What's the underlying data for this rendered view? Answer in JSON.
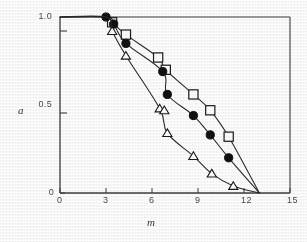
{
  "figure": {
    "background_color": "#ffffff",
    "ink_color": "#2b2b2b",
    "marker_edge_color": "#1a1a1a",
    "marker_open_fill": "#ffffff",
    "marker_filled_fill": "#111111"
  },
  "axes": {
    "x_title": "m",
    "y_title": "a",
    "x_ticks": [
      "0",
      "3",
      "6",
      "9",
      "12",
      "15"
    ],
    "y_ticks": [
      "0",
      "0.5",
      "1.0"
    ]
  },
  "chart_data": {
    "type": "line",
    "title": "",
    "subtitle": "",
    "xlabel": "m",
    "ylabel": "a",
    "xlim": [
      0,
      15
    ],
    "ylim": [
      0,
      1.0
    ],
    "x_ticks": [
      0,
      3,
      6,
      9,
      12,
      15
    ],
    "y_ticks": [
      0,
      0.5,
      1.0
    ],
    "grid": false,
    "legend": "none",
    "annotations": [
      "All three curves share a plateau at a = 1.0 for m from 0 to about 3",
      "All three curves converge to a = 0 at about m = 13"
    ],
    "series": [
      {
        "name": "open-square-series",
        "marker": "open-square",
        "marker_fill": "#ffffff",
        "marker_edge": "#1a1a1a",
        "line_color": "#2b2b2b",
        "points": [
          {
            "x": 0.0,
            "y": 1.0
          },
          {
            "x": 3.0,
            "y": 1.0
          },
          {
            "x": 3.4,
            "y": 0.97
          },
          {
            "x": 4.3,
            "y": 0.9
          },
          {
            "x": 6.4,
            "y": 0.77
          },
          {
            "x": 6.9,
            "y": 0.7
          },
          {
            "x": 8.7,
            "y": 0.56
          },
          {
            "x": 9.8,
            "y": 0.47
          },
          {
            "x": 11.0,
            "y": 0.32
          },
          {
            "x": 13.0,
            "y": 0.0
          }
        ],
        "markers_drawn_at": [
          {
            "x": 3.4,
            "y": 0.97
          },
          {
            "x": 4.3,
            "y": 0.9
          },
          {
            "x": 6.4,
            "y": 0.77
          },
          {
            "x": 6.9,
            "y": 0.7
          },
          {
            "x": 8.7,
            "y": 0.56
          },
          {
            "x": 9.8,
            "y": 0.47
          },
          {
            "x": 11.0,
            "y": 0.32
          }
        ]
      },
      {
        "name": "filled-circle-series",
        "marker": "filled-circle",
        "marker_fill": "#111111",
        "marker_edge": "#111111",
        "line_color": "#2b2b2b",
        "points": [
          {
            "x": 0.0,
            "y": 1.0
          },
          {
            "x": 3.0,
            "y": 1.0
          },
          {
            "x": 3.5,
            "y": 0.96
          },
          {
            "x": 4.3,
            "y": 0.85
          },
          {
            "x": 6.7,
            "y": 0.69
          },
          {
            "x": 7.0,
            "y": 0.56
          },
          {
            "x": 8.7,
            "y": 0.44
          },
          {
            "x": 9.8,
            "y": 0.33
          },
          {
            "x": 11.0,
            "y": 0.2
          },
          {
            "x": 13.0,
            "y": 0.0
          }
        ],
        "markers_drawn_at": [
          {
            "x": 3.0,
            "y": 1.0
          },
          {
            "x": 3.5,
            "y": 0.96
          },
          {
            "x": 4.3,
            "y": 0.85
          },
          {
            "x": 6.7,
            "y": 0.69
          },
          {
            "x": 7.0,
            "y": 0.56
          },
          {
            "x": 8.7,
            "y": 0.44
          },
          {
            "x": 9.8,
            "y": 0.33
          },
          {
            "x": 11.0,
            "y": 0.2
          }
        ]
      },
      {
        "name": "open-triangle-series",
        "marker": "open-triangle",
        "marker_fill": "#ffffff",
        "marker_edge": "#1a1a1a",
        "line_color": "#2b2b2b",
        "points": [
          {
            "x": 0.0,
            "y": 1.0
          },
          {
            "x": 3.0,
            "y": 1.0
          },
          {
            "x": 3.4,
            "y": 0.92
          },
          {
            "x": 4.3,
            "y": 0.78
          },
          {
            "x": 6.5,
            "y": 0.48
          },
          {
            "x": 7.0,
            "y": 0.34
          },
          {
            "x": 8.7,
            "y": 0.21
          },
          {
            "x": 9.9,
            "y": 0.11
          },
          {
            "x": 11.3,
            "y": 0.04
          },
          {
            "x": 13.0,
            "y": 0.0
          }
        ],
        "markers_drawn_at": [
          {
            "x": 3.4,
            "y": 0.92
          },
          {
            "x": 4.3,
            "y": 0.78
          },
          {
            "x": 6.5,
            "y": 0.48
          },
          {
            "x": 6.8,
            "y": 0.47
          },
          {
            "x": 7.0,
            "y": 0.34
          },
          {
            "x": 8.7,
            "y": 0.21
          },
          {
            "x": 9.9,
            "y": 0.11
          },
          {
            "x": 11.3,
            "y": 0.04
          }
        ]
      }
    ]
  }
}
